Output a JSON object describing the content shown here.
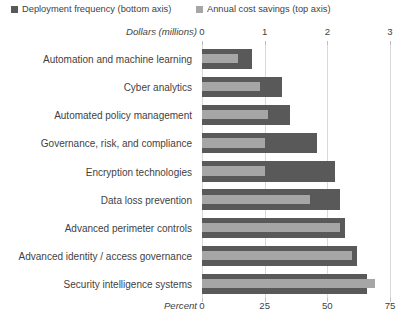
{
  "legend": {
    "items": [
      {
        "label": "Deployment frequency (bottom axis)",
        "color": "#595959",
        "name": "legend-deployment-frequency"
      },
      {
        "label": "Annual cost savings (top axis)",
        "color": "#a6a6a6",
        "name": "legend-annual-cost-savings"
      }
    ]
  },
  "axes": {
    "top_caption": "Dollars (millions)",
    "bottom_caption": "Percent",
    "top_ticks": [
      "0",
      "1",
      "2",
      "3"
    ],
    "bottom_ticks": [
      "0",
      "25",
      "50",
      "75"
    ]
  },
  "chart_data": {
    "type": "bar",
    "orientation": "horizontal",
    "title": "",
    "grid": true,
    "legend_position": "top",
    "categories": [
      "Automation and machine learning",
      "Cyber analytics",
      "Automated policy management",
      "Governance, risk, and compliance",
      "Encryption technologies",
      "Data loss prevention",
      "Advanced perimeter controls",
      "Advanced identity / access governance",
      "Security intelligence systems"
    ],
    "series": [
      {
        "name": "Deployment frequency (bottom axis)",
        "axis": "bottom",
        "xlabel": "Percent",
        "xlim": [
          0,
          75
        ],
        "color": "#595959",
        "values": [
          20,
          32,
          35,
          46,
          53,
          55,
          57,
          62,
          66
        ]
      },
      {
        "name": "Annual cost savings (top axis)",
        "axis": "top",
        "xlabel": "Dollars (millions)",
        "xlim": [
          0,
          3
        ],
        "color": "#a6a6a6",
        "values": [
          0.57,
          0.93,
          1.05,
          1.0,
          1.0,
          1.72,
          2.2,
          2.4,
          2.76
        ]
      }
    ]
  }
}
